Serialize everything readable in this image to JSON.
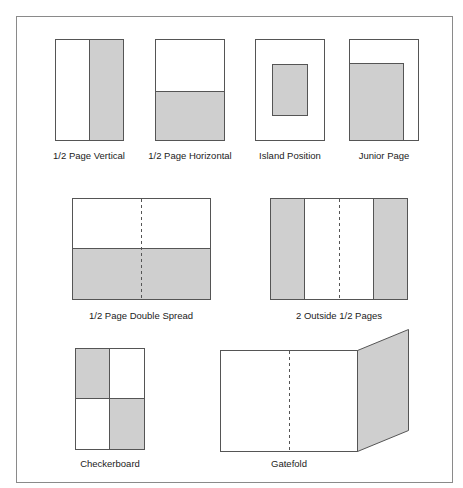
{
  "colors": {
    "background": "#ffffff",
    "frame": "#8a8a8a",
    "outline": "#555555",
    "ad_fill": "#cfcfcf",
    "page_fill": "#ffffff"
  },
  "layouts": [
    {
      "id": "half-page-vertical",
      "label": "1/2 Page Vertical"
    },
    {
      "id": "half-page-horizontal",
      "label": "1/2 Page Horizontal"
    },
    {
      "id": "island-position",
      "label": "Island Position"
    },
    {
      "id": "junior-page",
      "label": "Junior Page"
    },
    {
      "id": "half-page-double-spread",
      "label": "1/2 Page Double Spread"
    },
    {
      "id": "two-outside-half-pages",
      "label": "2 Outside 1/2 Pages"
    },
    {
      "id": "checkerboard",
      "label": "Checkerboard"
    },
    {
      "id": "gatefold",
      "label": "Gatefold"
    }
  ]
}
